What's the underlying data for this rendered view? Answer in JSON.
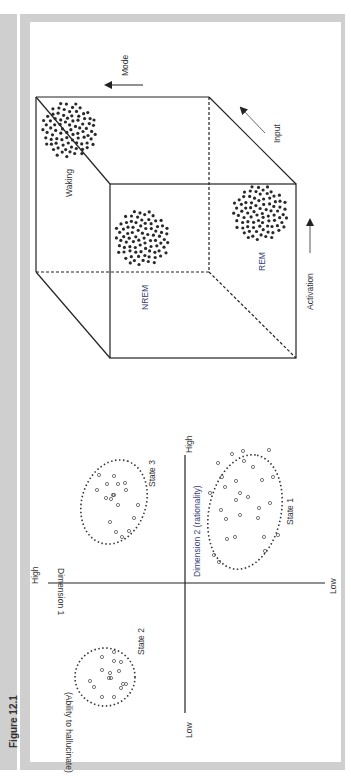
{
  "figure": {
    "label": "Figure 12.1"
  },
  "cube_model": {
    "axes": {
      "mode": "Mode",
      "input": "Input",
      "activation": "Activation"
    },
    "states": [
      {
        "name": "Waking"
      },
      {
        "name": "NREM"
      },
      {
        "name": "REM"
      }
    ]
  },
  "state_space": {
    "x_axis": {
      "title": "Dimension 2 (rationality)",
      "high": "High",
      "low": "Low"
    },
    "y_axis": {
      "title_line1": "Dimension 1",
      "title_line2": "(Ability to hallucinate)",
      "high": "High",
      "low": "Low"
    },
    "clusters": [
      {
        "name": "State 1"
      },
      {
        "name": "State 2"
      },
      {
        "name": "State 3"
      }
    ]
  },
  "colors": {
    "frame_gray": "#cfcfcf",
    "line": "#222222",
    "dot": "#2a2a2a",
    "label_blue": "#3b3f7a"
  }
}
